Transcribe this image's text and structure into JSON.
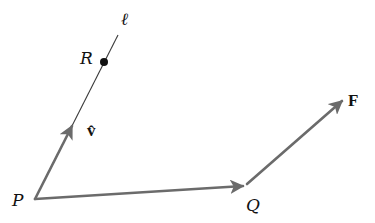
{
  "diagram": {
    "labels": {
      "P": "P",
      "Q": "Q",
      "R": "R",
      "F": "F",
      "v_hat": "v̂",
      "line": "ℓ"
    },
    "colors": {
      "vector": "#6b6b6b",
      "line": "#3a3a3a",
      "point": "#111111",
      "background": "#ffffff"
    },
    "points": {
      "P": [
        35,
        199
      ],
      "Q": [
        245,
        186
      ],
      "R": [
        104,
        62
      ],
      "F_tip": [
        343,
        100
      ],
      "v_tip": [
        72,
        125
      ],
      "line_top": [
        118,
        35
      ]
    },
    "edges": [
      {
        "from": "P",
        "to": "Q",
        "kind": "vector",
        "label": "PQ"
      },
      {
        "from": "Q",
        "to": "F_tip",
        "kind": "vector",
        "label": "F"
      },
      {
        "from": "P",
        "to": "v_tip",
        "kind": "vector",
        "label": "v̂"
      },
      {
        "from": "P",
        "to": "line_top",
        "kind": "line",
        "label": "ℓ"
      }
    ]
  }
}
